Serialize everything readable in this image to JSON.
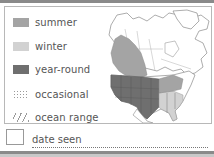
{
  "legend": {
    "items": [
      {
        "label": "summer",
        "color": "#a4a4a4",
        "style": "solid"
      },
      {
        "label": "winter",
        "color": "#d2d2d2",
        "style": "solid"
      },
      {
        "label": "year-round",
        "color": "#6f6f6f",
        "style": "solid"
      },
      {
        "label": "occasional",
        "color": "#9a9a9a",
        "style": "dotted"
      },
      {
        "label": "ocean range",
        "color": "#9a9a9a",
        "style": "hatched"
      }
    ]
  },
  "map": {
    "region": "North America",
    "colors": {
      "land": "#ffffff",
      "outline": "#8a8a8a",
      "summer": "#a4a4a4",
      "winter": "#d2d2d2",
      "year_round": "#6f6f6f"
    }
  },
  "footer": {
    "date_label": "date seen"
  }
}
